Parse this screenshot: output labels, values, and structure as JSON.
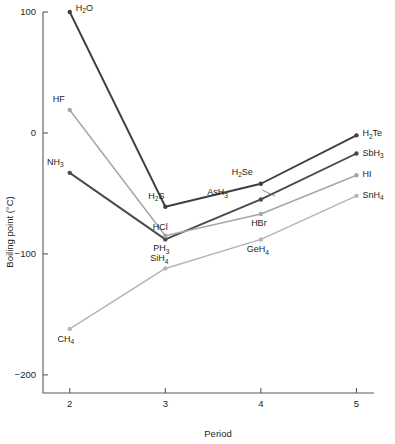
{
  "chart_data": {
    "type": "line",
    "title": "",
    "xlabel": "Period",
    "ylabel": "Boiling point (°C)",
    "x": [
      2,
      3,
      4,
      5
    ],
    "xlim": [
      1.72,
      5.1
    ],
    "ylim": [
      -215,
      100
    ],
    "xticks": [
      "2",
      "3",
      "4",
      "5"
    ],
    "yticks": [
      "100",
      "0",
      "-100",
      "-200"
    ],
    "ytick_values": [
      100,
      0,
      -100,
      -200
    ],
    "grid": false,
    "legend": "none",
    "series": [
      {
        "name": "group-16-hydrides",
        "color": "#3f3f42",
        "width": 1.9,
        "values": [
          100,
          -61,
          -42,
          -2
        ],
        "labels": [
          "H2O",
          "H2S",
          "H2Se",
          "H2Te"
        ]
      },
      {
        "name": "group-15-hydrides",
        "color": "#4a4a4d",
        "width": 1.9,
        "values": [
          -33,
          -88,
          -55,
          -17
        ],
        "labels": [
          "NH3",
          "PH3",
          "AsH3",
          "SbH3"
        ]
      },
      {
        "name": "group-17-hydrides",
        "color": "#a6a6a8",
        "width": 1.5,
        "values": [
          19,
          -85,
          -67,
          -35
        ],
        "labels": [
          "HF",
          "HCl",
          "HBr",
          "HI"
        ]
      },
      {
        "name": "group-14-hydrides",
        "color": "#b5b5b7",
        "width": 1.5,
        "values": [
          -162,
          -112,
          -88,
          -52
        ],
        "labels": [
          "CH4",
          "SiH4",
          "GeH4",
          "SnH4"
        ]
      }
    ],
    "annotations": [
      {
        "id": "H2O",
        "text_main": "H",
        "text_sub": "2",
        "text_tail": "O",
        "x": 2,
        "y": 100,
        "dx": 6,
        "dy": -1,
        "anchor": "start"
      },
      {
        "id": "H2S",
        "text_main": "H",
        "text_sub": "2",
        "text_tail": "S",
        "x": 3,
        "y": -61,
        "dx": -9,
        "dy": -8,
        "anchor": "middle"
      },
      {
        "id": "H2Se",
        "text_main": "H",
        "text_sub": "2",
        "text_tail": "Se",
        "x": 4,
        "y": -42,
        "dx": -8,
        "dy": -9,
        "anchor": "end"
      },
      {
        "id": "H2Te",
        "text_main": "H",
        "text_sub": "2",
        "text_tail": "Te",
        "x": 5,
        "y": -2,
        "dx": 6,
        "dy": 1,
        "anchor": "start"
      },
      {
        "id": "NH3",
        "text_main": "NH",
        "text_sub": "3",
        "text_tail": "",
        "x": 2,
        "y": -33,
        "dx": -6,
        "dy": -8,
        "anchor": "end"
      },
      {
        "id": "PH3",
        "text_main": "PH",
        "text_sub": "3",
        "text_tail": "",
        "x": 3,
        "y": -88,
        "dx": -4,
        "dy": 12,
        "anchor": "middle"
      },
      {
        "id": "AsH3",
        "text_main": "AsH",
        "text_sub": "3",
        "text_tail": "",
        "x": 4,
        "y": -55,
        "dx": -33,
        "dy": -4,
        "anchor": "end"
      },
      {
        "id": "SbH3",
        "text_main": "SbH",
        "text_sub": "3",
        "text_tail": "",
        "x": 5,
        "y": -17,
        "dx": 6,
        "dy": 2,
        "anchor": "start"
      },
      {
        "id": "HF",
        "text_main": "HF",
        "text_sub": "",
        "text_tail": "",
        "x": 2,
        "y": 19,
        "dx": -5,
        "dy": -8,
        "anchor": "end"
      },
      {
        "id": "HCl",
        "text_main": "HCl",
        "text_sub": "",
        "text_tail": "",
        "x": 3,
        "y": -85,
        "dx": -5,
        "dy": -6,
        "anchor": "middle"
      },
      {
        "id": "HBr",
        "text_main": "HBr",
        "text_sub": "",
        "text_tail": "",
        "x": 4,
        "y": -67,
        "dx": -2,
        "dy": 12,
        "anchor": "middle"
      },
      {
        "id": "HI",
        "text_main": "HI",
        "text_sub": "",
        "text_tail": "",
        "x": 5,
        "y": -35,
        "dx": 6,
        "dy": 2,
        "anchor": "start"
      },
      {
        "id": "CH4",
        "text_main": "CH",
        "text_sub": "4",
        "text_tail": "",
        "x": 2,
        "y": -162,
        "dx": -4,
        "dy": 13,
        "anchor": "middle"
      },
      {
        "id": "SiH4",
        "text_main": "SiH",
        "text_sub": "4",
        "text_tail": "",
        "x": 3,
        "y": -112,
        "dx": -6,
        "dy": -7,
        "anchor": "middle"
      },
      {
        "id": "GeH4",
        "text_main": "GeH",
        "text_sub": "4",
        "text_tail": "",
        "x": 4,
        "y": -88,
        "dx": -3,
        "dy": 13,
        "anchor": "middle"
      },
      {
        "id": "SnH4",
        "text_main": "SnH",
        "text_sub": "4",
        "text_tail": "",
        "x": 5,
        "y": -52,
        "dx": 6,
        "dy": 2,
        "anchor": "start"
      }
    ],
    "leaders": [
      {
        "id": "AsH3-leader",
        "x1_px": 262,
        "y1_px": 190,
        "x2_px": 275,
        "y2_px": 196
      }
    ]
  }
}
